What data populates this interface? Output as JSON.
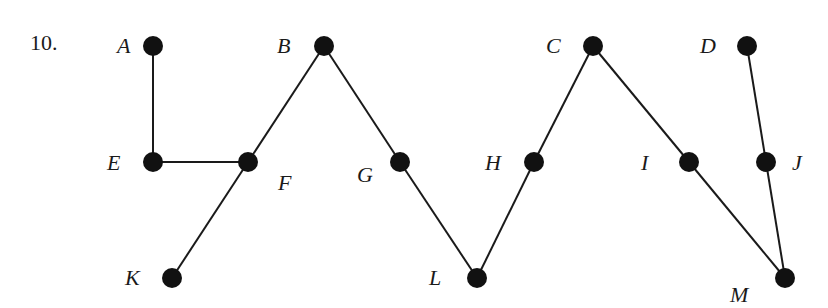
{
  "problem_number": "10.",
  "colors": {
    "node": "#111111",
    "edge": "#1a1a1a",
    "label": "#1a1a1a",
    "background": "#ffffff"
  },
  "graph": {
    "nodes": [
      {
        "id": "A",
        "label": "A",
        "x": 153,
        "y": 46,
        "lx": 117,
        "ly": 53
      },
      {
        "id": "B",
        "label": "B",
        "x": 324,
        "y": 46,
        "lx": 277,
        "ly": 53
      },
      {
        "id": "C",
        "label": "C",
        "x": 593,
        "y": 46,
        "lx": 546,
        "ly": 53
      },
      {
        "id": "D",
        "label": "D",
        "x": 747,
        "y": 46,
        "lx": 700,
        "ly": 53
      },
      {
        "id": "E",
        "label": "E",
        "x": 153,
        "y": 162,
        "lx": 107,
        "ly": 170
      },
      {
        "id": "F",
        "label": "F",
        "x": 248,
        "y": 162,
        "lx": 278,
        "ly": 190
      },
      {
        "id": "G",
        "label": "G",
        "x": 400,
        "y": 162,
        "lx": 357,
        "ly": 182
      },
      {
        "id": "H",
        "label": "H",
        "x": 534,
        "y": 162,
        "lx": 485,
        "ly": 170
      },
      {
        "id": "I",
        "label": "I",
        "x": 689,
        "y": 162,
        "lx": 641,
        "ly": 170
      },
      {
        "id": "J",
        "label": "J",
        "x": 766,
        "y": 162,
        "lx": 792,
        "ly": 170
      },
      {
        "id": "K",
        "label": "K",
        "x": 172,
        "y": 278,
        "lx": 125,
        "ly": 285
      },
      {
        "id": "L",
        "label": "L",
        "x": 477,
        "y": 278,
        "lx": 429,
        "ly": 285
      },
      {
        "id": "M",
        "label": "M",
        "x": 785,
        "y": 278,
        "lx": 730,
        "ly": 302
      }
    ],
    "edges": [
      [
        "A",
        "E"
      ],
      [
        "E",
        "F"
      ],
      [
        "F",
        "B"
      ],
      [
        "F",
        "K"
      ],
      [
        "B",
        "G"
      ],
      [
        "G",
        "L"
      ],
      [
        "L",
        "H"
      ],
      [
        "H",
        "C"
      ],
      [
        "C",
        "I"
      ],
      [
        "I",
        "M"
      ],
      [
        "D",
        "J"
      ],
      [
        "J",
        "M"
      ]
    ]
  }
}
